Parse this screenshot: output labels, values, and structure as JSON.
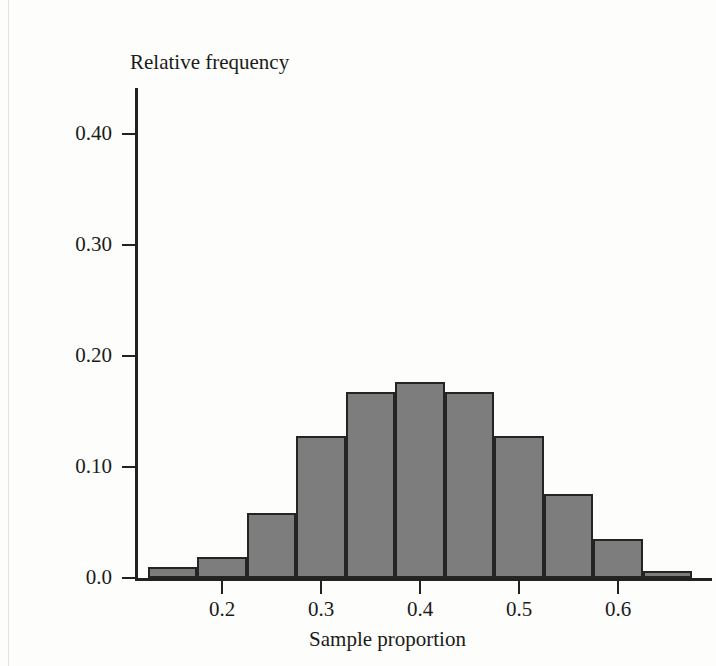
{
  "figure": {
    "background_color": "#fdfdfb",
    "bar_fill_color": "#7d7d7d",
    "bar_edge_color": "#242422",
    "axis_color": "#222220"
  },
  "chart_data": {
    "type": "bar",
    "title": "",
    "subtitle": "",
    "xlabel": "Sample proportion",
    "ylabel": "Relative frequency",
    "grid": false,
    "legend": null,
    "xlim": [
      0.115,
      0.69
    ],
    "ylim": [
      0.0,
      0.45
    ],
    "xticks": [
      0.2,
      0.3,
      0.4,
      0.5,
      0.6
    ],
    "xtick_labels": [
      "0.2",
      "0.3",
      "0.4",
      "0.5",
      "0.6"
    ],
    "yticks": [
      0.0,
      0.1,
      0.2,
      0.3,
      0.4
    ],
    "ytick_labels": [
      "0.0",
      "0.10",
      "0.20",
      "0.30",
      "0.40"
    ],
    "bin_width": 0.05,
    "bin_edges": [
      0.125,
      0.175,
      0.225,
      0.275,
      0.325,
      0.375,
      0.425,
      0.475,
      0.525,
      0.575,
      0.625,
      0.675
    ],
    "categories": [
      "0.125-0.175",
      "0.175-0.225",
      "0.225-0.275",
      "0.275-0.325",
      "0.325-0.375",
      "0.375-0.425",
      "0.425-0.475",
      "0.475-0.525",
      "0.525-0.575",
      "0.575-0.625",
      "0.625-0.675"
    ],
    "values": [
      0.01,
      0.019,
      0.059,
      0.128,
      0.168,
      0.177,
      0.168,
      0.128,
      0.076,
      0.035,
      0.006
    ],
    "bars": [
      {
        "bin_start": 0.125,
        "bin_end": 0.175,
        "value": 0.01
      },
      {
        "bin_start": 0.175,
        "bin_end": 0.225,
        "value": 0.019
      },
      {
        "bin_start": 0.225,
        "bin_end": 0.275,
        "value": 0.059
      },
      {
        "bin_start": 0.275,
        "bin_end": 0.325,
        "value": 0.128
      },
      {
        "bin_start": 0.325,
        "bin_end": 0.375,
        "value": 0.168
      },
      {
        "bin_start": 0.375,
        "bin_end": 0.425,
        "value": 0.177
      },
      {
        "bin_start": 0.425,
        "bin_end": 0.475,
        "value": 0.168
      },
      {
        "bin_start": 0.475,
        "bin_end": 0.525,
        "value": 0.128
      },
      {
        "bin_start": 0.525,
        "bin_end": 0.575,
        "value": 0.076
      },
      {
        "bin_start": 0.575,
        "bin_end": 0.625,
        "value": 0.035
      },
      {
        "bin_start": 0.625,
        "bin_end": 0.675,
        "value": 0.006
      }
    ]
  }
}
